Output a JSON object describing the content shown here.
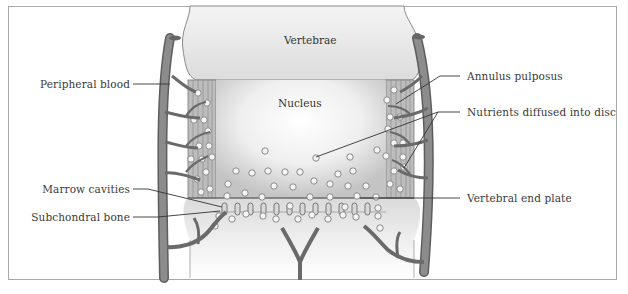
{
  "diagram": {
    "title_regions": {
      "vertebrae": "Vertebrae",
      "nucleus": "Nucleus"
    },
    "labels_left": [
      {
        "id": "peripheral-blood",
        "text": "Peripheral blood"
      },
      {
        "id": "marrow-cavities",
        "text": "Marrow cavities"
      },
      {
        "id": "subchondral-bone",
        "text": "Subchondral bone"
      }
    ],
    "labels_right": [
      {
        "id": "annulus-pulposus",
        "text": "Annulus pulposus"
      },
      {
        "id": "nutrients-diffused",
        "text": "Nutrients diffused into disc"
      },
      {
        "id": "vertebral-end-plate",
        "text": "Vertebral end plate"
      }
    ],
    "colors": {
      "vessel": "#7d7d7d",
      "vessel_dark": "#5e5e5e",
      "vertebra_fill": "#e9e9e9",
      "annulus_fill": "#b9b9b9",
      "nucleus_center": "#ffffff",
      "nucleus_edge": "#c9c9c9",
      "leader_line": "#333333",
      "frame_border": "#a9a9a9",
      "text": "#3a3a3a"
    }
  }
}
